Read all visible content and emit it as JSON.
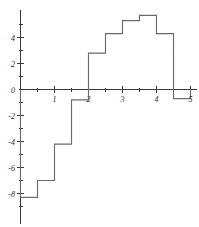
{
  "chart_data": {
    "type": "bar",
    "title": "",
    "subtitle": "",
    "xlabel": "",
    "ylabel": "",
    "style": "step-histogram",
    "grid": false,
    "legend": false,
    "xlim": [
      0,
      5
    ],
    "ylim": [
      -10,
      6.2
    ],
    "x_ticks_major": [
      1,
      2,
      3,
      4,
      5
    ],
    "x_tick_labels": [
      "1",
      "2",
      "3",
      "4",
      "5"
    ],
    "x_ticks_minor": [
      0.5,
      1.5,
      2.5,
      3.5,
      4.5
    ],
    "y_ticks_major": [
      -8,
      -6,
      -4,
      -2,
      0,
      2,
      4
    ],
    "y_tick_labels": [
      "-8",
      "-6",
      "-4",
      "-2",
      "0",
      "2",
      "4"
    ],
    "y_ticks_minor": [
      -9,
      -7,
      -5,
      -3,
      -1,
      1,
      3,
      5
    ],
    "bin_width": 0.5,
    "bin_edges": [
      0,
      0.5,
      1,
      1.5,
      2,
      2.5,
      3,
      3.5,
      4,
      4.5,
      5
    ],
    "categories": [
      "0.0-0.5",
      "0.5-1.0",
      "1.0-1.5",
      "1.5-2.0",
      "2.0-2.5",
      "2.5-3.0",
      "3.0-3.5",
      "3.5-4.0",
      "4.0-4.5",
      "4.5-5.0"
    ],
    "values": [
      -8.3,
      -7.0,
      -4.2,
      -0.8,
      2.8,
      4.3,
      5.3,
      5.7,
      4.3,
      -0.7
    ],
    "clipped_bins": [
      "4.5-5.0"
    ],
    "series": [
      {
        "name": "step-function",
        "values": [
          -8.3,
          -7.0,
          -4.2,
          -0.8,
          2.8,
          4.3,
          5.3,
          5.7,
          4.3,
          -0.7
        ]
      }
    ]
  },
  "colors": {
    "background": "#ffffff",
    "axis": "#3a3a3a",
    "step_line": "#6b6b6b",
    "tick_text": "#2b2b2b"
  }
}
